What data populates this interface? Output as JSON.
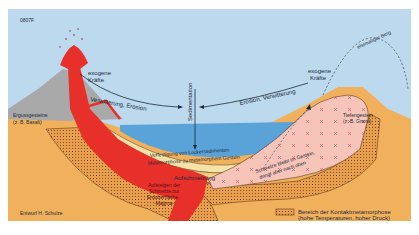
{
  "figure": {
    "code": "0807F",
    "credit": "Entwurf H. Schulze"
  },
  "labels": {
    "volcano_rock": [
      "Ergussgesteine",
      "(z. B. Basalt)"
    ],
    "exogenous_left": [
      "exogene",
      "Kräfte"
    ],
    "exogenous_right": [
      "exogene",
      "Kräfte"
    ],
    "weathering_left": "Verwitterung, Erosion",
    "weathering_right": "Erosion, Verwitterung",
    "sedimentation": "Sedimentation",
    "former_mountain": "ehemaliger Berg",
    "plutonic_rock": [
      "Tiefengestein",
      "(z. B. Granit)"
    ],
    "consolidation": "Verfestigung von Lockersedimenten",
    "metamorphosis": "Metamorphose zu metamorphem Gestein",
    "melting": "Aufschmelzung",
    "magma_rise": [
      "Aufsteigen der",
      "Schmelze zur",
      "Erdoberfläche",
      "-Magma-"
    ],
    "melt_stays": [
      "Schmelze bleibt im Gestein,",
      "dringt aber nach oben"
    ]
  },
  "legend": {
    "line1": "Bereich der Kontaktmetamorphose",
    "line2": "(hohe Temperaturen, hoher Druck)"
  },
  "colors": {
    "sky": "#bcd9ee",
    "sea": "#5aa3d8",
    "ground": "#f1b15c",
    "magma": "#e8302a",
    "granite": "#f6c4b8",
    "sediment_light": "#f5e2a8",
    "volcano_grey": "#a9a9a9",
    "contact_zone": "#e9a04e",
    "text": "#1d2a3a"
  }
}
